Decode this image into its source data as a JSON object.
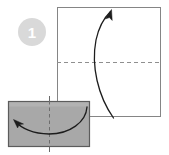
{
  "figure": {
    "type": "origami-instruction-diagram",
    "background_color": "#ffffff",
    "step_badge": {
      "label": "1",
      "shape": "circle",
      "fill_color": "#d8d8d8",
      "text_color": "#ffffff",
      "center_x": 32,
      "center_y": 32,
      "radius": 14
    },
    "shapes": [
      {
        "name": "paper-square",
        "kind": "square",
        "x": 57,
        "y": 7,
        "width": 104,
        "height": 110,
        "fill_color": "#ffffff",
        "stroke_color": "#808080"
      },
      {
        "name": "folded-rectangle",
        "kind": "rectangle",
        "x": 8,
        "y": 101,
        "width": 82,
        "height": 46,
        "fill_color": "#a8a8a8",
        "stroke_color": "#5a5a5a"
      }
    ],
    "fold_lines": [
      {
        "name": "horizontal-fold-line",
        "orientation": "horizontal",
        "x1": 57,
        "y1": 62,
        "x2": 161,
        "y2": 62,
        "style": "dashed",
        "color": "#8c8c8c"
      },
      {
        "name": "vertical-fold-line",
        "orientation": "vertical",
        "x1": 49,
        "y1": 96,
        "x2": 49,
        "y2": 152,
        "style": "dashed",
        "color": "#6a6a6a"
      }
    ],
    "arrows": [
      {
        "name": "unfold-arrow-up",
        "description": "Large curved arrow sweeping from bottom of square upward to top",
        "direction": "up",
        "start_x": 113,
        "start_y": 118,
        "end_x": 110,
        "end_y": 11,
        "color": "#1a1a1a"
      },
      {
        "name": "fold-arrow-left",
        "description": "Curved arrow inside gray rectangle sweeping right to left",
        "direction": "left",
        "start_x": 86,
        "start_y": 108,
        "end_x": 14,
        "end_y": 121,
        "color": "#1a1a1a"
      }
    ],
    "colors": {
      "paper_white": "#ffffff",
      "paper_gray": "#a8a8a8",
      "outline_light": "#808080",
      "outline_dark": "#5a5a5a",
      "dash_gray": "#8c8c8c",
      "arrow_black": "#1a1a1a",
      "badge_gray": "#d8d8d8"
    }
  }
}
